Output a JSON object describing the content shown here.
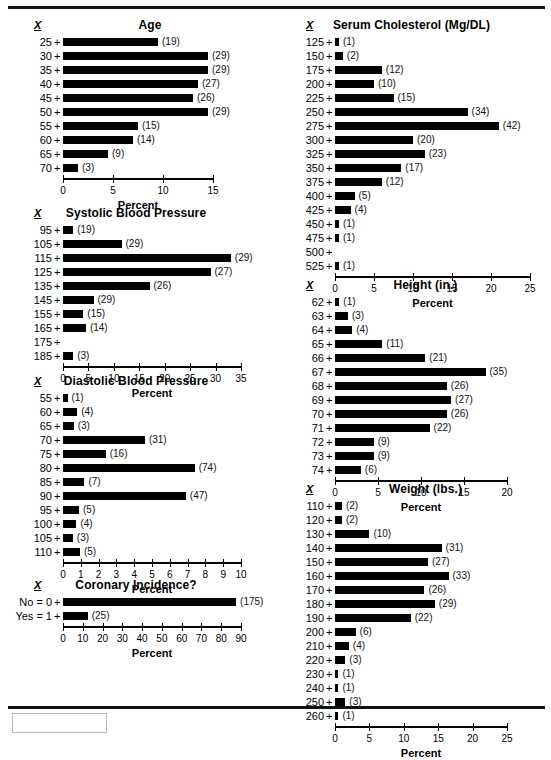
{
  "page": {
    "x_symbol": "X",
    "axis_title": "Percent",
    "left_column_order": [
      "age",
      "systolic",
      "diastolic",
      "coronary"
    ],
    "right_column_order": [
      "cholesterol",
      "height",
      "weight"
    ]
  },
  "chart_data": [
    {
      "id": "age",
      "type": "bar",
      "orientation": "horizontal",
      "title": "Age",
      "xlabel": "Percent",
      "ylabel": "X",
      "xlim": [
        0,
        15
      ],
      "ticks": [
        0,
        5,
        10,
        15
      ],
      "grid": false,
      "legend": "none",
      "categories": [
        "25",
        "30",
        "35",
        "40",
        "45",
        "50",
        "55",
        "60",
        "65",
        "70"
      ],
      "values": [
        9.5,
        14.5,
        14.5,
        13.5,
        13.0,
        14.5,
        7.5,
        7.0,
        4.5,
        1.5
      ],
      "counts": [
        19,
        29,
        29,
        27,
        26,
        29,
        15,
        14,
        9,
        3
      ],
      "labels": [
        "(19)",
        "(29)",
        "(29)",
        "(27)",
        "(26)",
        "(29)",
        "(15)",
        "(14)",
        "(9)",
        "(3)"
      ]
    },
    {
      "id": "systolic",
      "type": "bar",
      "orientation": "horizontal",
      "title": "Systolic Blood Pressure",
      "xlabel": "Percent",
      "ylabel": "X",
      "xlim": [
        0,
        35
      ],
      "ticks": [
        0,
        5,
        10,
        15,
        20,
        25,
        30,
        35
      ],
      "grid": false,
      "legend": "none",
      "categories": [
        "95",
        "105",
        "115",
        "125",
        "135",
        "145",
        "155",
        "165",
        "175",
        "185"
      ],
      "values": [
        2.0,
        11.5,
        33.0,
        29.0,
        17.0,
        6.0,
        4.0,
        4.5,
        0,
        2.0
      ],
      "counts": [
        19,
        29,
        29,
        27,
        26,
        29,
        15,
        14,
        null,
        3
      ],
      "labels": [
        "(19)",
        "(29)",
        "(29)",
        "(27)",
        "(26)",
        "(29)",
        "(15)",
        "(14)",
        "",
        "(3)"
      ]
    },
    {
      "id": "diastolic",
      "type": "bar",
      "orientation": "horizontal",
      "title": "Diastolic Blood Pressure",
      "xlabel": "Percent",
      "ylabel": "X",
      "xlim": [
        0,
        10
      ],
      "ticks": [
        0,
        1,
        2,
        3,
        4,
        5,
        6,
        7,
        8,
        9,
        10
      ],
      "grid": false,
      "legend": "none",
      "categories": [
        "55",
        "60",
        "65",
        "70",
        "75",
        "80",
        "85",
        "90",
        "95",
        "100",
        "105",
        "110"
      ],
      "values": [
        0.25,
        0.8,
        0.6,
        4.6,
        2.4,
        7.4,
        1.2,
        6.9,
        0.9,
        0.75,
        0.55,
        0.95
      ],
      "counts": [
        1,
        4,
        3,
        31,
        16,
        74,
        7,
        47,
        5,
        4,
        3,
        5
      ],
      "labels": [
        "(1)",
        "(4)",
        "(3)",
        "(31)",
        "(16)",
        "(74)",
        "(7)",
        "(47)",
        "(5)",
        "(4)",
        "(3)",
        "(5)"
      ]
    },
    {
      "id": "coronary",
      "type": "bar",
      "orientation": "horizontal",
      "title": "Coronary Incidence?",
      "xlabel": "Percent",
      "ylabel": "X",
      "xlim": [
        0,
        90
      ],
      "ticks": [
        0,
        10,
        20,
        30,
        40,
        50,
        60,
        70,
        80,
        90
      ],
      "grid": false,
      "legend": "none",
      "categories": [
        "No = 0",
        "Yes = 1"
      ],
      "values": [
        87.5,
        12.5
      ],
      "counts": [
        175,
        25
      ],
      "labels": [
        "(175)",
        "(25)"
      ]
    },
    {
      "id": "cholesterol",
      "type": "bar",
      "orientation": "horizontal",
      "title": "Serum Cholesterol  (Mg/DL)",
      "xlabel": "Percent",
      "ylabel": "X",
      "xlim": [
        0,
        25
      ],
      "ticks": [
        0,
        5,
        10,
        15,
        20,
        25
      ],
      "grid": false,
      "legend": "none",
      "categories": [
        "125",
        "150",
        "175",
        "200",
        "225",
        "250",
        "275",
        "300",
        "325",
        "350",
        "375",
        "400",
        "425",
        "450",
        "475",
        "500",
        "525"
      ],
      "values": [
        0.5,
        1.0,
        6.0,
        5.0,
        7.5,
        17.0,
        21.0,
        10.0,
        11.5,
        8.5,
        6.0,
        2.5,
        2.0,
        0.5,
        0.5,
        0,
        0.5
      ],
      "counts": [
        1,
        2,
        12,
        10,
        15,
        34,
        42,
        20,
        23,
        17,
        12,
        5,
        4,
        1,
        1,
        null,
        1
      ],
      "labels": [
        "(1)",
        "(2)",
        "(12)",
        "(10)",
        "(15)",
        "(34)",
        "(42)",
        "(20)",
        "(23)",
        "(17)",
        "(12)",
        "(5)",
        "(4)",
        "(1)",
        "(1)",
        "",
        "(1)"
      ]
    },
    {
      "id": "height",
      "type": "bar",
      "orientation": "horizontal",
      "title": "Height (in.)",
      "xlabel": "Percent",
      "ylabel": "X",
      "xlim": [
        0,
        20
      ],
      "ticks": [
        0,
        5,
        10,
        15,
        20
      ],
      "grid": false,
      "legend": "none",
      "categories": [
        "62",
        "63",
        "64",
        "65",
        "66",
        "67",
        "68",
        "69",
        "70",
        "71",
        "72",
        "73",
        "74"
      ],
      "values": [
        0.5,
        1.5,
        2.0,
        5.5,
        10.5,
        17.5,
        13.0,
        13.5,
        13.0,
        11.0,
        4.5,
        4.5,
        3.0
      ],
      "counts": [
        1,
        3,
        4,
        11,
        21,
        35,
        26,
        27,
        26,
        22,
        9,
        9,
        6
      ],
      "labels": [
        "(1)",
        "(3)",
        "(4)",
        "(11)",
        "(21)",
        "(35)",
        "(26)",
        "(27)",
        "(26)",
        "(22)",
        "(9)",
        "(9)",
        "(6)"
      ]
    },
    {
      "id": "weight",
      "type": "bar",
      "orientation": "horizontal",
      "title": "Weight (lbs.)",
      "xlabel": "Percent",
      "ylabel": "X",
      "xlim": [
        0,
        25
      ],
      "ticks": [
        0,
        5,
        10,
        15,
        20,
        25
      ],
      "grid": false,
      "legend": "none",
      "categories": [
        "110",
        "120",
        "130",
        "140",
        "150",
        "160",
        "170",
        "180",
        "190",
        "200",
        "210",
        "220",
        "230",
        "240",
        "250",
        "260"
      ],
      "values": [
        1.0,
        1.0,
        5.0,
        15.5,
        13.5,
        16.5,
        13.0,
        14.5,
        11.0,
        3.0,
        2.0,
        1.5,
        0.5,
        0.5,
        1.5,
        0.5
      ],
      "counts": [
        2,
        2,
        10,
        31,
        27,
        33,
        26,
        29,
        22,
        6,
        4,
        3,
        1,
        1,
        3,
        1
      ],
      "labels": [
        "(2)",
        "(2)",
        "(10)",
        "(31)",
        "(27)",
        "(33)",
        "(26)",
        "(29)",
        "(22)",
        "(6)",
        "(4)",
        "(3)",
        "(1)",
        "(1)",
        "(3)",
        "(1)"
      ]
    }
  ]
}
